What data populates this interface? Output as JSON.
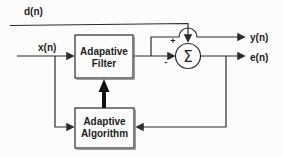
{
  "diagram": {
    "signals": {
      "desired": "d(n)",
      "input": "x(n)",
      "output": "y(n)",
      "error": "e(n)"
    },
    "blocks": {
      "filter": {
        "line1": "Adapative",
        "line2": "Filter"
      },
      "algorithm": {
        "line1": "Adaptive",
        "line2": "Algorithm"
      }
    },
    "summer": {
      "symbol": "Σ",
      "plus_sign": "+",
      "minus_sign": "-"
    },
    "colors": {
      "line": "#2b2b2b",
      "text": "#1c1c1c",
      "background": "#fcfcfc"
    }
  }
}
